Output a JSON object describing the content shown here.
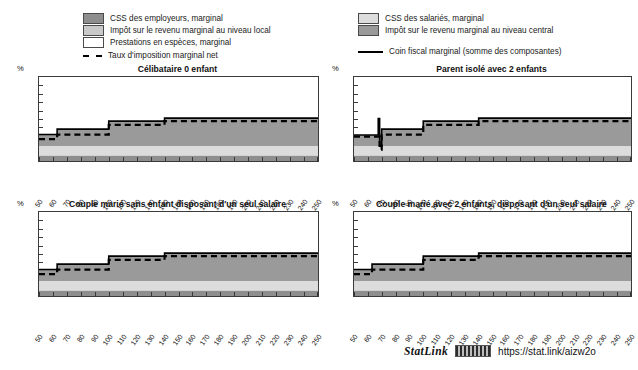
{
  "figure": {
    "statlink": {
      "word": "StatLink",
      "url": "https://stat.link/aizw2o",
      "glyph_icon": "barcode-icon"
    }
  },
  "legend_left": {
    "items": [
      {
        "label": "CSS des employeurs, marginal",
        "swatch": "dark-gray-swatch",
        "color": "#8e8e8e"
      },
      {
        "label": "Impôt sur le revenu marginal au niveau local",
        "swatch": "light-gray-swatch",
        "color": "#c9c9c9"
      },
      {
        "label": "Prestations en espèces, marginal",
        "swatch": "white-swatch",
        "color": "#ffffff"
      },
      {
        "label": "Taux d'imposition marginal net",
        "swatch": "dashed-line-swatch",
        "color": "#000000"
      }
    ]
  },
  "legend_right": {
    "items": [
      {
        "label": "CSS des salariés, marginal",
        "swatch": "pale-gray-swatch",
        "color": "#dcdcdc"
      },
      {
        "label": "Impôt sur le revenu marginal au niveau central",
        "swatch": "medium-gray-swatch",
        "color": "#9a9a9a"
      },
      {
        "label": "Coin fiscal marginal (somme des composantes)",
        "swatch": "solid-line-swatch",
        "color": "#000000"
      }
    ]
  },
  "axis": {
    "unit_label": "%",
    "yticks": [
      0,
      10,
      20,
      30,
      40,
      50,
      60,
      70,
      80,
      90,
      100
    ],
    "xticks": [
      50,
      60,
      70,
      80,
      90,
      100,
      110,
      120,
      130,
      140,
      150,
      160,
      170,
      180,
      190,
      200,
      210,
      220,
      230,
      240,
      250
    ]
  },
  "chart_data": [
    {
      "id": "celibataire-0-enfant",
      "type": "area",
      "title": "Célibataire 0 enfant",
      "xlabel": "",
      "ylabel": "%",
      "xlim": [
        50,
        250
      ],
      "ylim": [
        0,
        100
      ],
      "grid": false,
      "legend": "top",
      "x": [
        50,
        62,
        63,
        99,
        100,
        137,
        140,
        250
      ],
      "series": [
        {
          "name": "CSS des employeurs, marginal",
          "color": "#8e8e8e",
          "stack": 1,
          "values": [
            6.5,
            6.5,
            6.5,
            6.5,
            6.5,
            6.5,
            6.5,
            6.5
          ]
        },
        {
          "name": "CSS des salariés, marginal",
          "color": "#dcdcdc",
          "stack": 2,
          "values": [
            11.5,
            11.5,
            11.5,
            11.5,
            11.5,
            11.5,
            11.5,
            11.5
          ]
        },
        {
          "name": "Impôt sur le revenu marginal au niveau central",
          "color": "#9a9a9a",
          "stack": 3,
          "values": [
            13.5,
            13.5,
            20.0,
            20.0,
            29.5,
            29.5,
            33.0,
            33.0
          ]
        },
        {
          "name": "Impôt sur le revenu marginal au niveau local",
          "color": "#c9c9c9",
          "stack": 4,
          "values": [
            0,
            0,
            0,
            0,
            0,
            0,
            0,
            0
          ]
        },
        {
          "name": "Prestations en espèces, marginal",
          "color": "#ffffff",
          "stack": 5,
          "values": [
            0,
            0,
            0,
            0,
            0,
            0,
            0,
            0
          ]
        }
      ],
      "lines": [
        {
          "name": "Coin fiscal marginal (somme des composantes)",
          "style": "solid",
          "color": "#000000",
          "x": [
            50,
            62,
            63,
            99,
            100,
            137,
            140,
            250
          ],
          "values": [
            31.5,
            31.5,
            38.0,
            38.0,
            47.5,
            47.5,
            51.0,
            51.0
          ]
        },
        {
          "name": "Taux d'imposition marginal net",
          "style": "dashed",
          "color": "#000000",
          "x": [
            50,
            62,
            63,
            99,
            100,
            137,
            140,
            250
          ],
          "values": [
            26.0,
            26.0,
            31.5,
            31.5,
            43.0,
            43.0,
            47.5,
            47.5
          ]
        }
      ]
    },
    {
      "id": "parent-isole-2-enfants",
      "type": "area",
      "title": "Parent isolé avec 2 enfants",
      "xlabel": "",
      "ylabel": "%",
      "xlim": [
        50,
        250
      ],
      "ylim": [
        0,
        100
      ],
      "grid": false,
      "legend": "top",
      "x": [
        50,
        67,
        68,
        69,
        70,
        71,
        99,
        100,
        137,
        140,
        250
      ],
      "series": [
        {
          "name": "CSS des employeurs, marginal",
          "color": "#8e8e8e",
          "stack": 1,
          "values": [
            6.5,
            6.5,
            6.5,
            6.5,
            6.5,
            6.5,
            6.5,
            6.5,
            6.5,
            6.5,
            6.5
          ]
        },
        {
          "name": "CSS des salariés, marginal",
          "color": "#dcdcdc",
          "stack": 2,
          "values": [
            11.5,
            11.5,
            11.5,
            11.5,
            11.5,
            11.5,
            11.5,
            11.5,
            11.5,
            11.5,
            11.5
          ]
        },
        {
          "name": "Impôt sur le revenu marginal au niveau central",
          "color": "#9a9a9a",
          "stack": 3,
          "values": [
            13.0,
            13.0,
            13.0,
            13.0,
            20.0,
            20.0,
            20.0,
            29.5,
            29.5,
            33.0,
            33.0
          ]
        },
        {
          "name": "Impôt sur le revenu marginal au niveau local",
          "color": "#c9c9c9",
          "stack": 4,
          "values": [
            0,
            0,
            0,
            0,
            0,
            0,
            0,
            0,
            0,
            0,
            0
          ]
        },
        {
          "name": "Prestations en espèces, marginal",
          "color": "#ffffff",
          "stack": 5,
          "values": [
            0,
            0,
            0,
            0,
            0,
            0,
            0,
            0,
            0,
            0,
            0
          ]
        }
      ],
      "lines": [
        {
          "name": "Coin fiscal marginal (somme des composantes)",
          "style": "solid",
          "color": "#000000",
          "x": [
            50,
            67,
            67.5,
            68,
            68.5,
            69,
            70,
            99,
            100,
            137,
            140,
            250
          ],
          "values": [
            31.0,
            31.0,
            50.5,
            50.5,
            18.0,
            18.0,
            38.0,
            38.0,
            47.5,
            47.5,
            51.0,
            51.0
          ]
        },
        {
          "name": "Taux d'imposition marginal net",
          "style": "dashed",
          "color": "#000000",
          "x": [
            50,
            67,
            67.5,
            68,
            68.5,
            69,
            70,
            99,
            100,
            137,
            140,
            250
          ],
          "values": [
            29.0,
            29.0,
            29.0,
            29.0,
            13.5,
            13.5,
            31.5,
            31.5,
            43.0,
            43.0,
            47.5,
            47.5
          ]
        }
      ]
    },
    {
      "id": "couple-marie-sans-enfant",
      "type": "area",
      "title": "Couple marié sans enfant disposant d'un seul salaire",
      "xlabel": "",
      "ylabel": "%",
      "xlim": [
        50,
        250
      ],
      "ylim": [
        0,
        100
      ],
      "grid": false,
      "legend": "top",
      "x": [
        50,
        62,
        63,
        99,
        100,
        137,
        140,
        250
      ],
      "series": [
        {
          "name": "CSS des employeurs, marginal",
          "color": "#8e8e8e",
          "stack": 1,
          "values": [
            6.5,
            6.5,
            6.5,
            6.5,
            6.5,
            6.5,
            6.5,
            6.5
          ]
        },
        {
          "name": "CSS des salariés, marginal",
          "color": "#dcdcdc",
          "stack": 2,
          "values": [
            11.5,
            11.5,
            11.5,
            11.5,
            11.5,
            11.5,
            11.5,
            11.5
          ]
        },
        {
          "name": "Impôt sur le revenu marginal au niveau central",
          "color": "#9a9a9a",
          "stack": 3,
          "values": [
            13.5,
            13.5,
            20.0,
            20.0,
            29.5,
            29.5,
            33.0,
            33.0
          ]
        },
        {
          "name": "Impôt sur le revenu marginal au niveau local",
          "color": "#c9c9c9",
          "stack": 4,
          "values": [
            0,
            0,
            0,
            0,
            0,
            0,
            0,
            0
          ]
        },
        {
          "name": "Prestations en espèces, marginal",
          "color": "#ffffff",
          "stack": 5,
          "values": [
            0,
            0,
            0,
            0,
            0,
            0,
            0,
            0
          ]
        }
      ],
      "lines": [
        {
          "name": "Coin fiscal marginal (somme des composantes)",
          "style": "solid",
          "color": "#000000",
          "x": [
            50,
            62,
            63,
            99,
            100,
            137,
            140,
            250
          ],
          "values": [
            31.5,
            31.5,
            38.0,
            38.0,
            47.5,
            47.5,
            51.0,
            51.0
          ]
        },
        {
          "name": "Taux d'imposition marginal net",
          "style": "dashed",
          "color": "#000000",
          "x": [
            50,
            62,
            63,
            99,
            100,
            137,
            140,
            250
          ],
          "values": [
            26.0,
            26.0,
            31.5,
            31.5,
            43.0,
            43.0,
            47.5,
            47.5
          ]
        }
      ]
    },
    {
      "id": "couple-marie-2-enfants",
      "type": "area",
      "title": "Couple marié avec 2 enfants, disposant d'un seul salaire",
      "xlabel": "",
      "ylabel": "%",
      "xlim": [
        50,
        250
      ],
      "ylim": [
        0,
        100
      ],
      "grid": false,
      "legend": "top",
      "x": [
        50,
        62,
        63,
        99,
        100,
        137,
        140,
        250
      ],
      "series": [
        {
          "name": "CSS des employeurs, marginal",
          "color": "#8e8e8e",
          "stack": 1,
          "values": [
            6.5,
            6.5,
            6.5,
            6.5,
            6.5,
            6.5,
            6.5,
            6.5
          ]
        },
        {
          "name": "CSS des salariés, marginal",
          "color": "#dcdcdc",
          "stack": 2,
          "values": [
            11.5,
            11.5,
            11.5,
            11.5,
            11.5,
            11.5,
            11.5,
            11.5
          ]
        },
        {
          "name": "Impôt sur le revenu marginal au niveau central",
          "color": "#9a9a9a",
          "stack": 3,
          "values": [
            13.5,
            13.5,
            20.0,
            20.0,
            29.5,
            29.5,
            33.0,
            33.0
          ]
        },
        {
          "name": "Impôt sur le revenu marginal au niveau local",
          "color": "#c9c9c9",
          "stack": 4,
          "values": [
            0,
            0,
            0,
            0,
            0,
            0,
            0,
            0
          ]
        },
        {
          "name": "Prestations en espèces, marginal",
          "color": "#ffffff",
          "stack": 5,
          "values": [
            0,
            0,
            0,
            0,
            0,
            0,
            0,
            0
          ]
        }
      ],
      "lines": [
        {
          "name": "Coin fiscal marginal (somme des composantes)",
          "style": "solid",
          "color": "#000000",
          "x": [
            50,
            62,
            63,
            99,
            100,
            137,
            140,
            250
          ],
          "values": [
            31.5,
            31.5,
            38.0,
            38.0,
            47.5,
            47.5,
            51.0,
            51.0
          ]
        },
        {
          "name": "Taux d'imposition marginal net",
          "style": "dashed",
          "color": "#000000",
          "x": [
            50,
            62,
            63,
            99,
            100,
            137,
            140,
            250
          ],
          "values": [
            26.0,
            26.0,
            31.5,
            31.5,
            43.0,
            43.0,
            47.5,
            47.5
          ]
        }
      ]
    }
  ]
}
